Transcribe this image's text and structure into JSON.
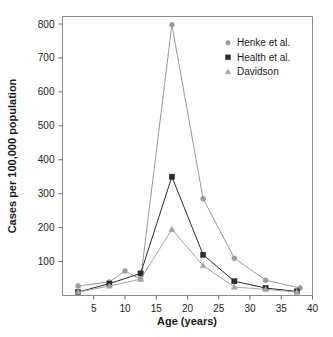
{
  "chart_data": {
    "type": "line",
    "title": "",
    "xlabel": "Age (years)",
    "ylabel": "Cases per 100,000 population",
    "xlim": [
      0,
      40
    ],
    "ylim": [
      0,
      840
    ],
    "xticks": [
      5,
      10,
      15,
      20,
      25,
      30,
      35,
      40
    ],
    "yticks": [
      100,
      200,
      300,
      400,
      500,
      600,
      700,
      800
    ],
    "grid": false,
    "legend_position": "top-right",
    "series": [
      {
        "name": "Henke et al.",
        "marker": "circle",
        "color": "#9a9a9a",
        "x": [
          2.5,
          7.5,
          10.0,
          12.5,
          17.5,
          22.5,
          27.5,
          32.5,
          38.0
        ],
        "values": [
          28,
          40,
          72,
          48,
          798,
          285,
          110,
          45,
          22
        ]
      },
      {
        "name": "Health et al.",
        "marker": "square",
        "color": "#2b2b2b",
        "x": [
          2.5,
          7.5,
          12.5,
          17.5,
          22.5,
          27.5,
          32.5,
          37.5
        ],
        "values": [
          10,
          35,
          65,
          350,
          120,
          42,
          22,
          12
        ]
      },
      {
        "name": "Davidson",
        "marker": "triangle",
        "color": "#a5a5a5",
        "x": [
          2.5,
          7.5,
          12.5,
          17.5,
          22.5,
          27.5,
          32.5,
          37.5
        ],
        "values": [
          10,
          28,
          48,
          195,
          88,
          25,
          18,
          10
        ]
      }
    ]
  },
  "legend": {
    "items": [
      {
        "label": "Henke et al.",
        "marker": "circle",
        "color": "#9a9a9a"
      },
      {
        "label": "Health et al.",
        "marker": "square",
        "color": "#2b2b2b"
      },
      {
        "label": "Davidson",
        "marker": "triangle",
        "color": "#a5a5a5"
      }
    ]
  },
  "axes": {
    "x_title": "Age (years)",
    "y_title": "Cases per 100,000 population",
    "x_tick_labels": [
      "5",
      "10",
      "15",
      "20",
      "25",
      "30",
      "35",
      "40"
    ],
    "y_tick_labels": [
      "100",
      "200",
      "300",
      "400",
      "500",
      "600",
      "700",
      "800"
    ]
  },
  "colors": {
    "frame": "#8c8c8c",
    "text": "#1a1a1a",
    "henke": "#9a9a9a",
    "health": "#2b2b2b",
    "davidson": "#a5a5a5"
  }
}
